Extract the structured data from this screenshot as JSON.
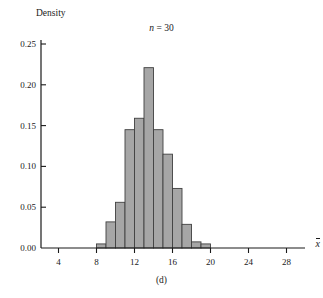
{
  "figure": {
    "panel_caption": "(d)",
    "title_prefix": "n",
    "title_rest": " = 30",
    "title_full": "n = 30",
    "sample_size": 30
  },
  "axes": {
    "y_label": "Density",
    "x_label": "x̄",
    "x_label_base": "x"
  },
  "colors": {
    "bar_fill": "#a6a6a6",
    "bar_stroke": "#404040",
    "axis": "#1a1a1a",
    "background": "#ffffff",
    "text": "#1a1a1a"
  },
  "chart_data": {
    "type": "bar",
    "title": "n = 30",
    "xlabel": "x̄",
    "ylabel": "Density",
    "xlim": [
      2,
      31
    ],
    "ylim": [
      0.0,
      0.26
    ],
    "grid": false,
    "legend": "none",
    "bin_width": 1,
    "x_ticks": [
      4,
      8,
      12,
      16,
      20,
      24,
      28
    ],
    "x_tick_labels": [
      "4",
      "8",
      "12",
      "16",
      "20",
      "24",
      "28"
    ],
    "y_ticks": [
      0.0,
      0.05,
      0.1,
      0.15,
      0.2,
      0.25
    ],
    "y_tick_labels": [
      "0.00",
      "0.05",
      "0.10",
      "0.15",
      "0.20",
      "0.25"
    ],
    "bin_edges": [
      8,
      9,
      10,
      11,
      12,
      13,
      14,
      15,
      16,
      17,
      18,
      19,
      20
    ],
    "categories": [
      "8-9",
      "9-10",
      "10-11",
      "11-12",
      "12-13",
      "13-14",
      "14-15",
      "15-16",
      "16-17",
      "17-18",
      "18-19",
      "19-20"
    ],
    "values": [
      0.005,
      0.032,
      0.056,
      0.145,
      0.159,
      0.221,
      0.145,
      0.115,
      0.073,
      0.029,
      0.0075,
      0.005
    ]
  }
}
